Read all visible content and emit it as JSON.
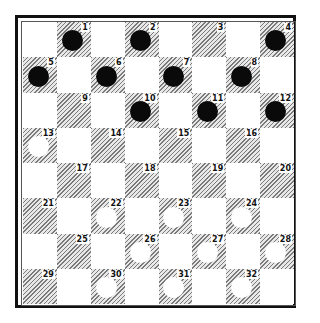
{
  "board": {
    "title": "Checkers board diagram",
    "squares": [
      {
        "n": "1",
        "piece": "black"
      },
      {
        "n": "2",
        "piece": "black"
      },
      {
        "n": "3",
        "piece": ""
      },
      {
        "n": "4",
        "piece": "black"
      },
      {
        "n": "5",
        "piece": "black"
      },
      {
        "n": "6",
        "piece": "black"
      },
      {
        "n": "7",
        "piece": "black"
      },
      {
        "n": "8",
        "piece": "black"
      },
      {
        "n": "9",
        "piece": ""
      },
      {
        "n": "10",
        "piece": "black"
      },
      {
        "n": "11",
        "piece": "black"
      },
      {
        "n": "12",
        "piece": "black"
      },
      {
        "n": "13",
        "piece": "white"
      },
      {
        "n": "14",
        "piece": ""
      },
      {
        "n": "15",
        "piece": ""
      },
      {
        "n": "16",
        "piece": ""
      },
      {
        "n": "17",
        "piece": ""
      },
      {
        "n": "18",
        "piece": ""
      },
      {
        "n": "19",
        "piece": ""
      },
      {
        "n": "20",
        "piece": ""
      },
      {
        "n": "21",
        "piece": ""
      },
      {
        "n": "22",
        "piece": "white"
      },
      {
        "n": "23",
        "piece": "white"
      },
      {
        "n": "24",
        "piece": "white"
      },
      {
        "n": "25",
        "piece": ""
      },
      {
        "n": "26",
        "piece": "white"
      },
      {
        "n": "27",
        "piece": "white"
      },
      {
        "n": "28",
        "piece": "white"
      },
      {
        "n": "29",
        "piece": ""
      },
      {
        "n": "30",
        "piece": "white"
      },
      {
        "n": "31",
        "piece": "white"
      },
      {
        "n": "32",
        "piece": "white"
      }
    ],
    "colors": {
      "dark_square": "#9a9a9a",
      "light_square": "#ffffff",
      "black_piece": "#0a0a0a",
      "white_piece": "#ffffff",
      "border": "#111111"
    }
  }
}
